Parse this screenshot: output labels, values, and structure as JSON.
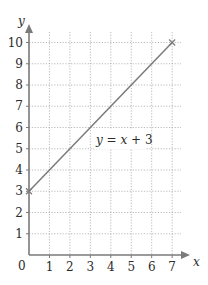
{
  "chart_data": {
    "type": "line",
    "title": "",
    "xlabel": "x",
    "ylabel": "y",
    "xlim": [
      0,
      7
    ],
    "ylim": [
      0,
      10
    ],
    "x_ticks": [
      "1",
      "2",
      "3",
      "4",
      "5",
      "6",
      "7"
    ],
    "y_ticks": [
      "1",
      "2",
      "3",
      "4",
      "5",
      "6",
      "7",
      "8",
      "9",
      "10"
    ],
    "origin_label": "0",
    "grid": true,
    "grid_style": "dotted",
    "series": [
      {
        "name": "y = x + 3",
        "x": [
          0,
          7
        ],
        "y": [
          3,
          10
        ],
        "endpoint_markers": "x"
      }
    ],
    "annotations": [
      {
        "text_parts": [
          "y",
          " = ",
          "x",
          " + 3"
        ],
        "x": 3.2,
        "y": 5.2
      }
    ],
    "colors": {
      "axis": "#7a7a7a",
      "grid": "#a8a8a8",
      "line": "#7a7a7a",
      "text": "#2b2b2b"
    }
  }
}
